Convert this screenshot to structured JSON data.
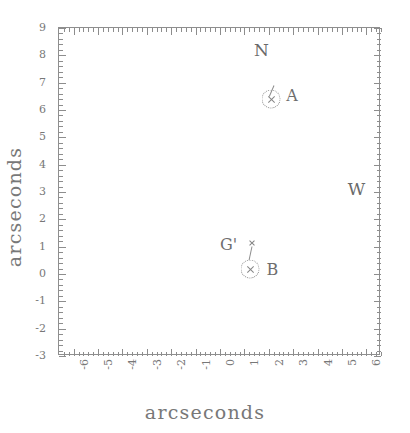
{
  "figure": {
    "xlabel": "arcseconds",
    "ylabel": "arcseconds"
  },
  "chart_data": {
    "type": "scatter",
    "title": "",
    "xlabel": "arcseconds",
    "ylabel": "arcseconds",
    "xlim": [
      -6.6,
      6.6
    ],
    "ylim": [
      -3,
      9
    ],
    "grid": false,
    "legend": "none",
    "xticks": [
      -6,
      -5,
      -4,
      -3,
      -2,
      -1,
      0,
      1,
      2,
      3,
      4,
      5,
      6
    ],
    "xticklabels": [
      "-6",
      "-5",
      "-4",
      "-3",
      "-2",
      "-1",
      "0",
      "1",
      "2",
      "3",
      "4",
      "5",
      "6"
    ],
    "yticks": [
      9,
      8,
      7,
      6,
      5,
      4,
      3,
      2,
      1,
      0,
      -1,
      -2,
      -3
    ],
    "yticklabels": [
      "9",
      "8",
      "7",
      "6",
      "5",
      "4",
      "3",
      "2",
      "1",
      "0",
      "-1",
      "-2",
      "-3"
    ],
    "minor_ticks": true,
    "tick_direction": "in",
    "points": [
      {
        "label": "A",
        "x": 2.1,
        "y": 6.4,
        "marker": "circled-x",
        "label_dx": 0.85,
        "label_dy": -0.15
      },
      {
        "label": "B",
        "x": 1.25,
        "y": 0.2,
        "marker": "circled-x",
        "label_dx": 0.9,
        "label_dy": 0.0
      },
      {
        "label": "G'",
        "x": 1.3,
        "y": 1.15,
        "marker": "x",
        "label_dx": -0.95,
        "label_dy": 0.05
      }
    ],
    "annotations": [
      {
        "text": "N",
        "x": 1.7,
        "y": 8.2
      },
      {
        "text": "W",
        "x": 5.6,
        "y": 3.1
      }
    ]
  },
  "ticklabels": {
    "x": [
      "-6",
      "-5",
      "-4",
      "-3",
      "-2",
      "-1",
      "0",
      "1",
      "2",
      "3",
      "4",
      "5",
      "6"
    ],
    "y": [
      "9",
      "8",
      "7",
      "6",
      "5",
      "4",
      "3",
      "2",
      "1",
      "0",
      "-1",
      "-2",
      "-3"
    ]
  },
  "style": {
    "ink": "#7a7a7a",
    "frame": "#8e8e8e",
    "background": "#ffffff"
  }
}
